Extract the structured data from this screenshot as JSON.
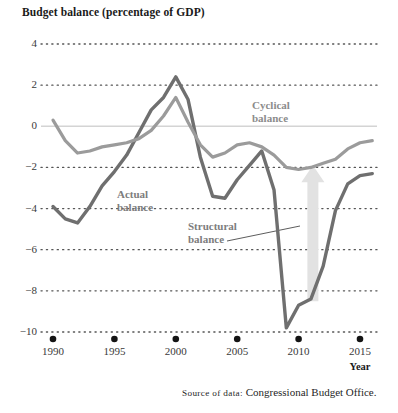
{
  "title": "Budget balance (percentage of GDP)",
  "source": {
    "prefix": "Source of data:",
    "text": "Congressional Budget Office."
  },
  "annotations": {
    "cyclical": {
      "line1": "Cyclical",
      "line2": "balance"
    },
    "actual": {
      "line1": "Actual",
      "line2": "balance"
    },
    "structural": {
      "line1": "Structural",
      "line2": "balance"
    }
  },
  "colors": {
    "actual_line": "#6f6f6f",
    "cyclical_line": "#9b9b9b",
    "arrow": "#e2e2e2",
    "gridline": "#555555",
    "zeroline": "#d4d4d4",
    "tick_dot": "#141414",
    "text": "#1a1a1a",
    "label_text": "#8c8c8c"
  },
  "chart_data": {
    "type": "line",
    "title": "Budget balance (percentage of GDP)",
    "xlabel": "Year",
    "ylabel": "Budget balance (percentage of GDP)",
    "xlim": [
      1990,
      2016
    ],
    "ylim": [
      -10,
      4
    ],
    "yticks": [
      4,
      2,
      0,
      -2,
      -4,
      -6,
      -8,
      -10
    ],
    "ytick_labels": [
      "4",
      "2",
      "0",
      "−2",
      "−4",
      "−6",
      "−8",
      "−10"
    ],
    "xticks": [
      1990,
      1995,
      2000,
      2005,
      2010,
      2015
    ],
    "xtick_labels": [
      "1990",
      "1995",
      "2000",
      "2005",
      "2010",
      "2015"
    ],
    "grid": "horizontal-dotted",
    "zero_line": true,
    "legend": "inline-annotations",
    "series": [
      {
        "name": "Actual balance",
        "color": "#6f6f6f",
        "x": [
          1990,
          1991,
          1992,
          1993,
          1994,
          1995,
          1996,
          1997,
          1998,
          1999,
          2000,
          2001,
          2002,
          2003,
          2004,
          2005,
          2006,
          2007,
          2008,
          2009,
          2010,
          2011,
          2012,
          2013,
          2014,
          2015,
          2016
        ],
        "values": [
          -3.9,
          -4.5,
          -4.7,
          -3.9,
          -2.9,
          -2.2,
          -1.4,
          -0.3,
          0.8,
          1.4,
          2.4,
          1.3,
          -1.5,
          -3.4,
          -3.5,
          -2.6,
          -1.9,
          -1.2,
          -3.1,
          -9.8,
          -8.7,
          -8.4,
          -6.8,
          -4.1,
          -2.8,
          -2.4,
          -2.3
        ]
      },
      {
        "name": "Cyclical balance",
        "color": "#9b9b9b",
        "x": [
          1990,
          1991,
          1992,
          1993,
          1994,
          1995,
          1996,
          1997,
          1998,
          1999,
          2000,
          2001,
          2002,
          2003,
          2004,
          2005,
          2006,
          2007,
          2008,
          2009,
          2010,
          2011,
          2012,
          2013,
          2014,
          2015,
          2016
        ],
        "values": [
          0.3,
          -0.7,
          -1.3,
          -1.2,
          -1.0,
          -0.9,
          -0.8,
          -0.6,
          -0.2,
          0.5,
          1.4,
          0.2,
          -0.9,
          -1.5,
          -1.3,
          -0.9,
          -0.8,
          -1.0,
          -1.4,
          -2.0,
          -2.1,
          -2.0,
          -1.8,
          -1.6,
          -1.1,
          -0.8,
          -0.7
        ]
      }
    ],
    "annotation_arrow": {
      "label": "Structural balance",
      "x": 2011,
      "from_value": -8.5,
      "to_value": -1.9,
      "direction": "up"
    }
  }
}
